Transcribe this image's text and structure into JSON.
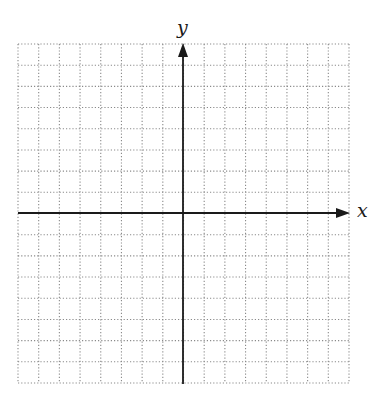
{
  "diagram": {
    "type": "coordinate-plane",
    "x_axis_label": "x",
    "y_axis_label": "y",
    "grid": {
      "columns": 16,
      "rows": 16,
      "left": 18,
      "top": 44,
      "right": 349,
      "bottom": 383,
      "line_style": "dotted",
      "line_color": "#8a8a8a"
    },
    "axes": {
      "origin_px": [
        183,
        213
      ],
      "color": "#1a1a1a",
      "x_arrow_direction": "right",
      "y_arrow_direction": "up"
    }
  }
}
